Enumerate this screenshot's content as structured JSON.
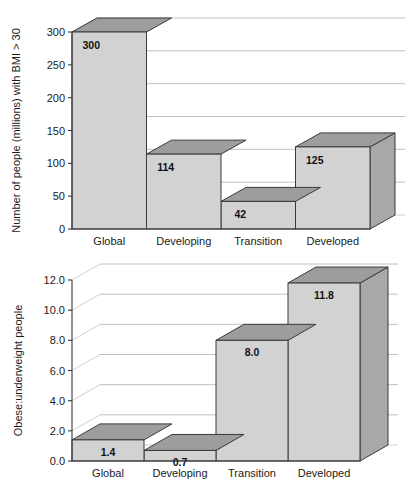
{
  "chart_data": [
    {
      "id": "obesity-counts",
      "type": "bar",
      "title": "",
      "subtitle": "",
      "xlabel": "",
      "ylabel": "Number of people (millions) with BMI > 30",
      "categories": [
        "Global",
        "Developing",
        "Transition",
        "Developed"
      ],
      "values": [
        300,
        114,
        42,
        125
      ],
      "value_labels": [
        "300",
        "114",
        "42",
        "125"
      ],
      "ytick_labels": [
        "0",
        "50",
        "100",
        "150",
        "200",
        "250",
        "300"
      ],
      "ytick_values": [
        0,
        50,
        100,
        150,
        200,
        250,
        300
      ],
      "ylim": [
        0,
        300
      ],
      "grid": true,
      "legend": "none",
      "style": "3d-bar",
      "colors": {
        "front": "#d2d2d2",
        "top": "#9d9d9d",
        "side": "#a8a8a8",
        "outline": "#3a3a3a",
        "grid": "#b9b9b9"
      }
    },
    {
      "id": "obese-underweight-ratio",
      "type": "bar",
      "title": "",
      "subtitle": "",
      "xlabel": "",
      "ylabel": "Obese:underweight people",
      "categories": [
        "Global",
        "Developing",
        "Transition",
        "Developed"
      ],
      "values": [
        1.4,
        0.7,
        8.0,
        11.8
      ],
      "value_labels": [
        "1.4",
        "0.7",
        "8.0",
        "11.8"
      ],
      "ytick_labels": [
        "0.0",
        "2.0",
        "4.0",
        "6.0",
        "8.0",
        "10.0",
        "12.0"
      ],
      "ytick_values": [
        0,
        2,
        4,
        6,
        8,
        10,
        12
      ],
      "ylim": [
        0,
        12
      ],
      "grid": true,
      "legend": "none",
      "style": "3d-bar",
      "colors": {
        "front": "#d2d2d2",
        "top": "#9d9d9d",
        "side": "#a8a8a8",
        "outline": "#3a3a3a",
        "grid": "#b9b9b9"
      }
    }
  ]
}
